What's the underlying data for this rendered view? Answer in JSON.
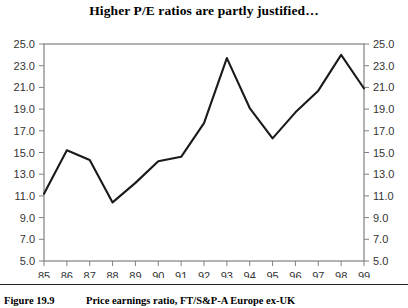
{
  "chart_data": {
    "type": "line",
    "title": "Higher P/E ratios are partly justified…",
    "xlabel": "",
    "ylabel": "",
    "categories": [
      "85",
      "86",
      "87",
      "88",
      "89",
      "90",
      "91",
      "92",
      "93",
      "94",
      "95",
      "96",
      "97",
      "98",
      "99"
    ],
    "values": [
      11.2,
      15.2,
      14.3,
      10.4,
      12.2,
      14.2,
      14.6,
      17.7,
      23.7,
      19.1,
      16.3,
      18.7,
      20.7,
      24.0,
      20.9
    ],
    "series": [
      {
        "name": "Price earnings ratio, FT/S&P-A Europe ex-UK",
        "values": [
          11.2,
          15.2,
          14.3,
          10.4,
          12.2,
          14.2,
          14.6,
          17.7,
          23.7,
          19.1,
          16.3,
          18.7,
          20.7,
          24.0,
          20.9
        ]
      }
    ],
    "ylim": [
      5.0,
      25.0
    ],
    "ytick_step": 2.0,
    "yticks": [
      "5.0",
      "7.0",
      "9.0",
      "11.0",
      "13.0",
      "15.0",
      "17.0",
      "19.0",
      "21.0",
      "23.0",
      "25.0"
    ],
    "yticks_right": [
      "5.0",
      "7.0",
      "9.0",
      "11.0",
      "13.0",
      "15.0",
      "17.0",
      "19.0",
      "21.0",
      "23.0",
      "25.0"
    ],
    "xticks": [
      "85",
      "86",
      "87",
      "88",
      "89",
      "90",
      "91",
      "92",
      "93",
      "94",
      "95",
      "96",
      "97",
      "98",
      "99"
    ],
    "grid": false,
    "legend": "none",
    "dual_y_axis": true,
    "line_color": "#1a1a1a",
    "frame_color": "#808080"
  },
  "caption": {
    "figure_number": "Figure 19.9",
    "description": "Price earnings ratio, FT/S&P-A Europe ex-UK"
  }
}
